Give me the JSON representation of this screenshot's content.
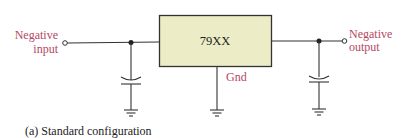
{
  "diagram": {
    "regulator": {
      "label": "79XX",
      "fill": "#ecedc6",
      "stroke": "#333333"
    },
    "input": {
      "line1": "Negative",
      "line2": "input"
    },
    "output": {
      "line1": "Negative",
      "line2": "output"
    },
    "gnd_label": "Gnd",
    "caption": "(a) Standard configuration",
    "colors": {
      "label": "#b5485f",
      "wire": "#333333"
    }
  }
}
